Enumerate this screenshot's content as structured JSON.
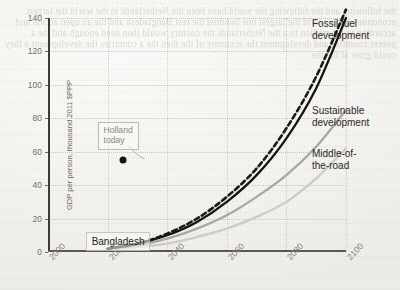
{
  "chart_data": {
    "type": "line",
    "title": "",
    "subtitle": "",
    "xlabel": "",
    "ylabel": "GDP per person, thousand 2011 $PPP",
    "xlim": [
      2000,
      2100
    ],
    "ylim": [
      0,
      140
    ],
    "xticks": [
      "2000",
      "2020",
      "2040",
      "2060",
      "2080",
      "2100"
    ],
    "yticks": [
      "0",
      "20",
      "40",
      "60",
      "80",
      "100",
      "120",
      "140"
    ],
    "grid": true,
    "legend_position": "right-inline-labels",
    "x": [
      2020,
      2030,
      2040,
      2050,
      2060,
      2070,
      2080,
      2090,
      2100
    ],
    "series": [
      {
        "name": "Fossil fuel development",
        "style": "solid",
        "color": "#14140f",
        "values": [
          2,
          5,
          10,
          18,
          30,
          46,
          68,
          98,
          140
        ]
      },
      {
        "name": "Fossil fuel development (variant)",
        "style": "dashed",
        "color": "#1a1a14",
        "values": [
          2,
          5,
          11,
          20,
          33,
          50,
          74,
          105,
          145
        ]
      },
      {
        "name": "Sustainable development",
        "style": "solid",
        "color": "#a9a7a1",
        "values": [
          2,
          4,
          8,
          14,
          22,
          33,
          46,
          63,
          85
        ]
      },
      {
        "name": "Middle-of-the-road",
        "style": "solid",
        "color": "#cdcbc6",
        "values": [
          2,
          3,
          5,
          9,
          14,
          21,
          30,
          44,
          62
        ]
      }
    ],
    "annotations": [
      {
        "name": "holland-today",
        "text": "Holland\ntoday",
        "point_x": 2022,
        "point_y": 55
      },
      {
        "name": "bangladesh",
        "text": "Bangladesh",
        "point_x": 2018,
        "point_y": 13
      }
    ]
  },
  "series_labels": {
    "fossil": "Fossil fuel\ndevelopment",
    "sustainable": "Sustainable\ndevelopment",
    "middle": "Middle-of-\nthe-road"
  },
  "background_bleed": "the following and the following the world have been the Netherlands in the world the largest economies in the world the largest one hundred the rest Bangladesh and the an open access and according to the million to a the Netherlands the country would then need enough and the a poorer countries and development the economy of the then the a countries the development a they could grow at the the"
}
